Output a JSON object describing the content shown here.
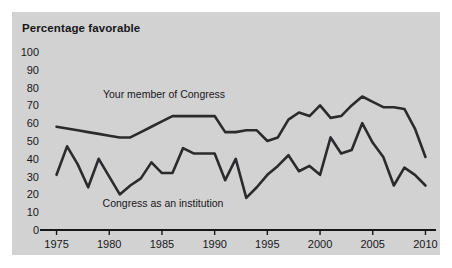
{
  "figure": {
    "title": "Percentage favorable",
    "panel_color": "#d2d2d2",
    "page_color": "#ffffff",
    "line_color": "#2b2b2e",
    "text_color": "#17171a"
  },
  "chart_data": {
    "type": "line",
    "title": "Percentage favorable",
    "xlabel": "",
    "ylabel": "",
    "ylim": [
      0,
      100
    ],
    "xlim": [
      1974,
      2011
    ],
    "grid": false,
    "legend": "inline-labels",
    "yticks": [
      0,
      10,
      20,
      30,
      40,
      50,
      60,
      70,
      80,
      90,
      100
    ],
    "xticks": [
      1975,
      1980,
      1985,
      1990,
      1995,
      2000,
      2005,
      2010
    ],
    "ytick_labels": [
      "0",
      "10",
      "20",
      "30",
      "40",
      "50",
      "60",
      "70",
      "80",
      "90",
      "100"
    ],
    "xtick_labels": [
      "1975",
      "1980",
      "1985",
      "1990",
      "1995",
      "2000",
      "2005",
      "2010"
    ],
    "x": [
      1975,
      1976,
      1977,
      1978,
      1979,
      1980,
      1981,
      1982,
      1983,
      1984,
      1985,
      1986,
      1987,
      1988,
      1989,
      1990,
      1991,
      1992,
      1993,
      1994,
      1995,
      1996,
      1997,
      1998,
      1999,
      2000,
      2001,
      2002,
      2003,
      2004,
      2005,
      2006,
      2007,
      2008,
      2009,
      2010
    ],
    "series": [
      {
        "name": "Your member of Congress",
        "label": "Your member of Congress",
        "label_x": 1985.2,
        "label_y": 74,
        "values": [
          58,
          57,
          56,
          55,
          54,
          53,
          52,
          52,
          55,
          58,
          61,
          64,
          64,
          64,
          64,
          64,
          55,
          55,
          56,
          56,
          50,
          52,
          62,
          66,
          64,
          70,
          63,
          64,
          70,
          75,
          72,
          69,
          69,
          68,
          57,
          41
        ]
      },
      {
        "name": "Congress as an institution",
        "label": "Congress as an institution",
        "label_x": 1985.1,
        "label_y": 13,
        "values": [
          31,
          47,
          37,
          24,
          40,
          30,
          20,
          25,
          29,
          38,
          32,
          32,
          46,
          43,
          43,
          43,
          28,
          40,
          18,
          24,
          31,
          36,
          42,
          33,
          36,
          31,
          52,
          43,
          45,
          60,
          49,
          41,
          25,
          35,
          31,
          25
        ]
      }
    ]
  }
}
